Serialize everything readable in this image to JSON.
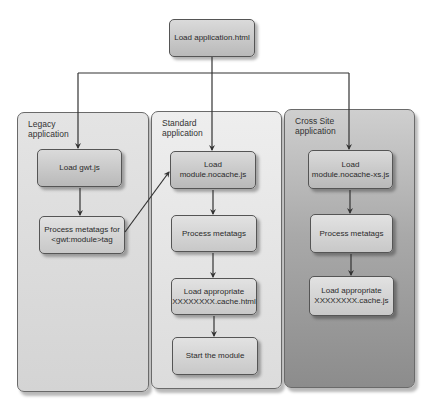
{
  "diagram": {
    "root": {
      "label": "Load application.html"
    },
    "panels": [
      {
        "id": "legacy",
        "title_line1": "Legacy",
        "title_line2": "application",
        "steps": [
          {
            "line1": "Load gwt.js",
            "line2": ""
          },
          {
            "line1": "Process metatags for",
            "line2": "<gwt:module>tag"
          }
        ]
      },
      {
        "id": "standard",
        "title_line1": "Standard",
        "title_line2": "application",
        "steps": [
          {
            "line1": "Load",
            "line2": "module.nocache.js"
          },
          {
            "line1": "Process metatags",
            "line2": ""
          },
          {
            "line1": "Load appropriate",
            "line2": "XXXXXXXX.cache.html"
          },
          {
            "line1": "Start the module",
            "line2": ""
          }
        ]
      },
      {
        "id": "cross-site",
        "title_line1": "Cross Site",
        "title_line2": "application",
        "steps": [
          {
            "line1": "Load",
            "line2": "module.nocache-xs.js"
          },
          {
            "line1": "Process metatags",
            "line2": ""
          },
          {
            "line1": "Load appropriate",
            "line2": "XXXXXXXX.cache.js"
          }
        ]
      }
    ],
    "connections": [
      {
        "from": "Load application.html",
        "to": "Load gwt.js"
      },
      {
        "from": "Load application.html",
        "to": "Load module.nocache.js"
      },
      {
        "from": "Load application.html",
        "to": "Load module.nocache-xs.js"
      },
      {
        "from": "Load gwt.js",
        "to": "Process metatags for <gwt:module>tag"
      },
      {
        "from": "Process metatags for <gwt:module>tag",
        "to": "Load module.nocache.js"
      },
      {
        "from": "Load module.nocache.js",
        "to": "Process metatags"
      },
      {
        "from": "Process metatags",
        "to": "Load appropriate XXXXXXXX.cache.html"
      },
      {
        "from": "Load appropriate XXXXXXXX.cache.html",
        "to": "Start the module"
      },
      {
        "from": "Load module.nocache-xs.js",
        "to": "Process metatags"
      },
      {
        "from": "Process metatags",
        "to": "Load appropriate XXXXXXXX.cache.js"
      }
    ]
  }
}
